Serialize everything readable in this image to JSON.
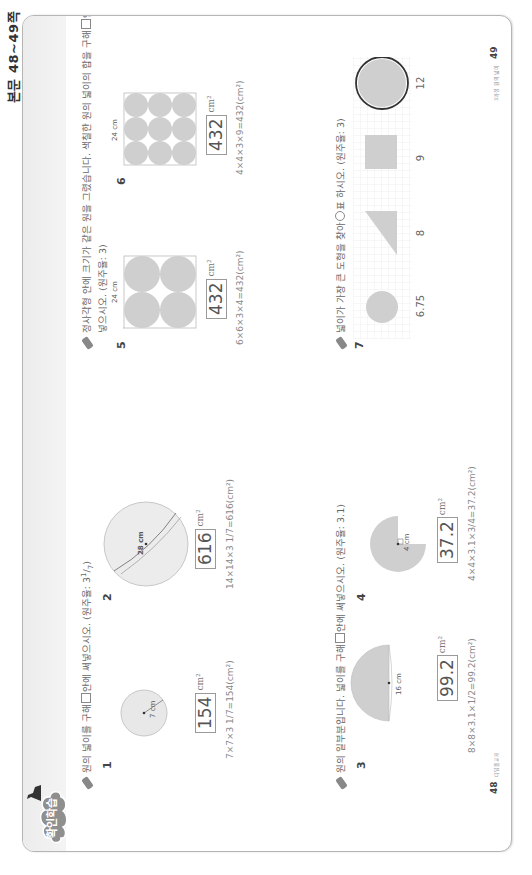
{
  "header": {
    "page_range": "본문 48~49쪽"
  },
  "badge": {
    "label": "확인학습"
  },
  "sections": [
    {
      "instruction": "원의 넓이를 구해 □ 안에 써넣으시오. (원주율: 3 1/7)",
      "instruction_pre": "원의 넓이를 구해",
      "instruction_post": "안에 써넣으시오. (원주율: 3",
      "pi_frac": {
        "num": "1",
        "den": "7"
      },
      "problems": [
        {
          "number": "1",
          "dimension": "7 cm",
          "answer": "154",
          "unit": "cm²",
          "formula": "7×7×3 1/7=154(cm²)"
        },
        {
          "number": "2",
          "dimension": "28 cm",
          "answer": "616",
          "unit": "cm²",
          "formula": "14×14×3 1/7=616(cm²)"
        }
      ]
    },
    {
      "instruction": "원의 일부분입니다. 넓이를 구해 □ 안에 써넣으시오. (원주율: 3.1)",
      "instruction_pre": "원의 일부분입니다. 넓이를 구해",
      "instruction_post": "안에 써넣으시오. (원주율: 3.1)",
      "problems": [
        {
          "number": "3",
          "dimension": "16 cm",
          "answer": "99.2",
          "unit": "cm²",
          "formula": "8×8×3.1×1/2=99.2(cm²)"
        },
        {
          "number": "4",
          "dimension": "4 cm",
          "answer": "37.2",
          "unit": "cm²",
          "formula": "4×4×3.1×3/4=37.2(cm²)"
        }
      ]
    },
    {
      "instruction_line1_pre": "정사각형 안에 크기가 같은 원을 그렸습니다. 색칠한 원의 넓이의 합을 구해",
      "instruction_line1_post": "안에 써",
      "instruction_line2": "넣으시오. (원주율: 3)",
      "problems": [
        {
          "number": "5",
          "dimension": "24 cm",
          "answer": "432",
          "unit": "cm²",
          "formula": "6×6×3×4=432(cm²)",
          "grid": "2x2"
        },
        {
          "number": "6",
          "dimension": "24 cm",
          "answer": "432",
          "unit": "cm²",
          "formula": "4×4×3×9=432(cm²)",
          "grid": "3x3"
        }
      ]
    },
    {
      "instruction": "넓이가 가장 큰 도형을 찾아 ○표 하시오. (원주율: 3)",
      "instruction_pre": "넓이가 가장 큰 도형을 찾아",
      "instruction_post": "표 하시오. (원주율: 3)",
      "problems": [
        {
          "number": "7",
          "shapes": [
            {
              "type": "circle",
              "area": "6.75"
            },
            {
              "type": "triangle",
              "area": "8"
            },
            {
              "type": "square",
              "area": "9"
            },
            {
              "type": "circle",
              "area": "12",
              "circled": true
            }
          ]
        }
      ]
    }
  ],
  "footer": {
    "left_page": "48",
    "left_text": "디딤돌교재",
    "right_page": "49",
    "right_text": "3과정 원의 넓이"
  },
  "colors": {
    "shape_fill": "#cfcfcf",
    "band": "#ececec",
    "badge": "#8f8f8f",
    "ring": "#333333"
  }
}
